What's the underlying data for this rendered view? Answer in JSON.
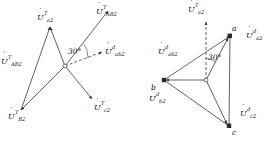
{
  "figure": {
    "title": "",
    "background": "#ffffff",
    "stroke_color": "#3a3a3a",
    "text_color": "#111111",
    "width": 277,
    "height": 145
  },
  "left_diagram": {
    "name": "transformer-side-phasor-star",
    "origin_label": "",
    "angle_marker": "30°",
    "vectors": [
      {
        "id": "Ua2T",
        "u": "U",
        "sub": "a2",
        "sup": "T",
        "dashed": false,
        "label_x": 37,
        "label_y": 14
      },
      {
        "id": "UAB2T",
        "u": "U",
        "sub": "AB2",
        "sup": "T",
        "dashed": false,
        "label_x": 1,
        "label_y": 58
      },
      {
        "id": "UAb2T",
        "u": "U",
        "sub": "AB2",
        "sup": "T",
        "dashed": false,
        "label_x": 96,
        "label_y": 8
      },
      {
        "id": "Uab2d",
        "u": "U",
        "sub": "ab2",
        "sup": "d",
        "dashed": true,
        "label_x": 105,
        "label_y": 48
      },
      {
        "id": "UB2T",
        "u": "U",
        "sub": "B2",
        "sup": "T",
        "dashed": false,
        "label_x": 8,
        "label_y": 113
      },
      {
        "id": "Uc2T",
        "u": "U",
        "sub": "c2",
        "sup": "T",
        "dashed": false,
        "label_x": 94,
        "label_y": 104
      }
    ]
  },
  "right_diagram": {
    "name": "load-side-phasor-triangle",
    "angle_marker": "30°",
    "vertices": [
      {
        "id": "a",
        "label": "a",
        "label_x": 232,
        "label_y": 28
      },
      {
        "id": "b",
        "label": "b",
        "label_x": 151,
        "label_y": 83
      },
      {
        "id": "c",
        "label": "c",
        "label_x": 232,
        "label_y": 131
      }
    ],
    "vectors": [
      {
        "id": "Ua2T",
        "u": "U",
        "sub": "a2",
        "sup": "T",
        "dashed": true,
        "label_x": 188,
        "label_y": 6
      },
      {
        "id": "Uab2d",
        "u": "U",
        "sub": "ab2",
        "sup": "d",
        "dashed": false,
        "label_x": 158,
        "label_y": 48
      },
      {
        "id": "Ua2d",
        "u": "U",
        "sub": "a2",
        "sup": "d",
        "dashed": false,
        "label_x": 246,
        "label_y": 32
      },
      {
        "id": "Ub2d",
        "u": "U",
        "sub": "b2",
        "sup": "d",
        "dashed": false,
        "label_x": 149,
        "label_y": 95
      },
      {
        "id": "Uc2d",
        "u": "U",
        "sub": "c2",
        "sup": "d",
        "dashed": false,
        "label_x": 240,
        "label_y": 110
      }
    ]
  }
}
